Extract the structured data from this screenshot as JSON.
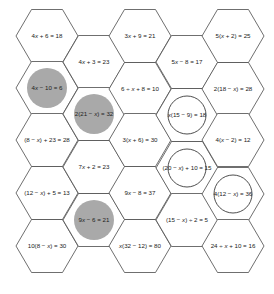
{
  "puzzle": {
    "colors": {
      "hex_stroke": "#4a4a4a",
      "shaded_circle": "#a9a9a9",
      "ring_circle": "#3a3a3a",
      "text": "#222222",
      "background": "#ffffff"
    },
    "hex_size": {
      "half_width": 31,
      "half_height": 26.5
    },
    "cells": [
      {
        "id": "c0r0",
        "col": 0,
        "row": 0,
        "cx": 47,
        "cy": 36,
        "equation": "4x + 6 = 18",
        "mark": "none"
      },
      {
        "id": "c0r1",
        "col": 0,
        "row": 1,
        "cx": 47,
        "cy": 88,
        "equation": "4x − 10 = 6",
        "mark": "shaded"
      },
      {
        "id": "c0r2",
        "col": 0,
        "row": 2,
        "cx": 47,
        "cy": 140,
        "equation": "(8 − x) + 23 = 28",
        "mark": "none"
      },
      {
        "id": "c0r3",
        "col": 0,
        "row": 3,
        "cx": 47,
        "cy": 193,
        "equation": "(12 − x) + 5 = 13",
        "mark": "none"
      },
      {
        "id": "c0r4",
        "col": 0,
        "row": 4,
        "cx": 47,
        "cy": 246,
        "equation": "10(8 − x) = 30",
        "mark": "none"
      },
      {
        "id": "c1r0",
        "col": 1,
        "row": 0,
        "cx": 94,
        "cy": 62,
        "equation": "4x + 3 = 23",
        "mark": "none"
      },
      {
        "id": "c1r1",
        "col": 1,
        "row": 1,
        "cx": 94,
        "cy": 114,
        "equation": "2(21 − x) = 32",
        "mark": "shaded"
      },
      {
        "id": "c1r2",
        "col": 1,
        "row": 2,
        "cx": 94,
        "cy": 167,
        "equation": "7x + 2 = 23",
        "mark": "none"
      },
      {
        "id": "c1r3",
        "col": 1,
        "row": 3,
        "cx": 94,
        "cy": 220,
        "equation": "9x − 6 = 21",
        "mark": "shaded"
      },
      {
        "id": "c2r0",
        "col": 2,
        "row": 0,
        "cx": 140,
        "cy": 36,
        "equation": "3x + 9 = 21",
        "mark": "none"
      },
      {
        "id": "c2r1",
        "col": 2,
        "row": 1,
        "cx": 140,
        "cy": 89,
        "equation": "6 ÷ x + 8 = 10",
        "mark": "none"
      },
      {
        "id": "c2r2",
        "col": 2,
        "row": 2,
        "cx": 140,
        "cy": 140,
        "equation": "3(x + 6) = 30",
        "mark": "none"
      },
      {
        "id": "c2r3",
        "col": 2,
        "row": 3,
        "cx": 140,
        "cy": 193,
        "equation": "9x − 8 = 37",
        "mark": "none"
      },
      {
        "id": "c2r4",
        "col": 2,
        "row": 4,
        "cx": 140,
        "cy": 246,
        "equation": "x(32 − 12) = 80",
        "mark": "none"
      },
      {
        "id": "c3r0",
        "col": 3,
        "row": 0,
        "cx": 187,
        "cy": 62,
        "equation": "5x − 8 = 17",
        "mark": "none"
      },
      {
        "id": "c3r1",
        "col": 3,
        "row": 1,
        "cx": 187,
        "cy": 115,
        "equation": "x(15 − 9) = 18",
        "mark": "ring"
      },
      {
        "id": "c3r2",
        "col": 3,
        "row": 2,
        "cx": 187,
        "cy": 168,
        "equation": "(20 − x) + 10 = 15",
        "mark": "ring"
      },
      {
        "id": "c3r3",
        "col": 3,
        "row": 3,
        "cx": 187,
        "cy": 220,
        "equation": "(15 − x) ÷ 2 = 5",
        "mark": "none"
      },
      {
        "id": "c4r0",
        "col": 4,
        "row": 0,
        "cx": 233,
        "cy": 36,
        "equation": "5(x + 2) = 25",
        "mark": "none"
      },
      {
        "id": "c4r1",
        "col": 4,
        "row": 1,
        "cx": 233,
        "cy": 89,
        "equation": "2(18 − x) = 28",
        "mark": "none"
      },
      {
        "id": "c4r2",
        "col": 4,
        "row": 2,
        "cx": 233,
        "cy": 140,
        "equation": "4(x − 2) = 12",
        "mark": "none"
      },
      {
        "id": "c4r3",
        "col": 4,
        "row": 3,
        "cx": 233,
        "cy": 194,
        "equation": "4(12 − x) = 36",
        "mark": "ring"
      },
      {
        "id": "c4r4",
        "col": 4,
        "row": 4,
        "cx": 233,
        "cy": 246,
        "equation": "24 ÷ x + 10 = 16",
        "mark": "none"
      }
    ]
  }
}
